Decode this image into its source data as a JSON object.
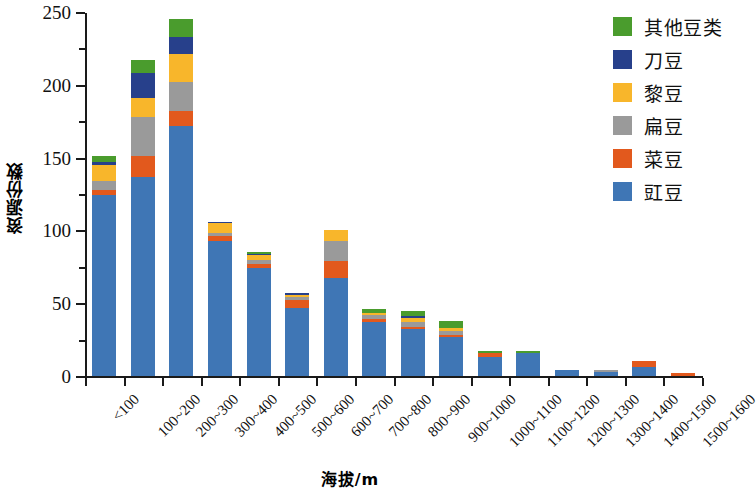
{
  "chart_data": {
    "type": "bar",
    "subtype": "stacked-bar",
    "title": "",
    "xlabel": "海拔/m",
    "ylabel": "资源份数",
    "ylim": [
      0,
      250
    ],
    "ytick_step": 50,
    "yminor_step": 25,
    "yticks": [
      0,
      50,
      100,
      150,
      200,
      250
    ],
    "grid": false,
    "legend_position": "top-right",
    "categories": [
      "<100",
      "100~200",
      "200~300",
      "300~400",
      "400~500",
      "500~600",
      "600~700",
      "700~800",
      "800~900",
      "900~1000",
      "1000~1100",
      "1100~1200",
      "1200~1300",
      "1300~1400",
      "1400~1500",
      "1500~1600"
    ],
    "series": [
      {
        "name": "豇豆",
        "color": "#3f76b5",
        "values": [
          124,
          137,
          172,
          93,
          74,
          47,
          67,
          37,
          32,
          27,
          13,
          16,
          4,
          3,
          6,
          0
        ]
      },
      {
        "name": "菜豆",
        "color": "#e2591d",
        "values": [
          4,
          14,
          10,
          3,
          3,
          5,
          12,
          2,
          2,
          1,
          3,
          0,
          0,
          0,
          4,
          2
        ]
      },
      {
        "name": "扁豆",
        "color": "#9a9a9a",
        "values": [
          6,
          27,
          20,
          2,
          3,
          2,
          14,
          3,
          3,
          3,
          0,
          0,
          0,
          1,
          0,
          0
        ]
      },
      {
        "name": "黎豆",
        "color": "#f8b62b",
        "values": [
          11,
          13,
          19,
          7,
          3,
          2,
          7,
          1,
          3,
          2,
          0,
          0,
          0,
          0,
          0,
          0
        ]
      },
      {
        "name": "刀豆",
        "color": "#27408b",
        "values": [
          2,
          17,
          12,
          1,
          1,
          1,
          0,
          0,
          1,
          0,
          0,
          0,
          0,
          0,
          0,
          0
        ]
      },
      {
        "name": "其他豆类",
        "color": "#4a9c2d",
        "values": [
          4,
          9,
          12,
          0,
          1,
          0,
          0,
          3,
          4,
          5,
          1,
          1,
          0,
          0,
          0,
          0
        ]
      }
    ],
    "totals": [
      151,
      217,
      245,
      106,
      85,
      57,
      100,
      46,
      45,
      38,
      17,
      17,
      4,
      4,
      10,
      2
    ]
  },
  "legend": {
    "items": [
      {
        "label": "其他豆类",
        "color": "#4a9c2d"
      },
      {
        "label": "刀豆",
        "color": "#27408b"
      },
      {
        "label": "黎豆",
        "color": "#f8b62b"
      },
      {
        "label": "扁豆",
        "color": "#9a9a9a"
      },
      {
        "label": "菜豆",
        "color": "#e2591d"
      },
      {
        "label": "豇豆",
        "color": "#3f76b5"
      }
    ]
  },
  "axes": {
    "y_title": "资源份数",
    "x_title": "海拔/m",
    "ytick_labels": [
      "0",
      "50",
      "100",
      "150",
      "200",
      "250"
    ]
  }
}
